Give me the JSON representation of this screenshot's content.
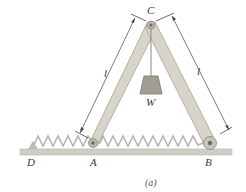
{
  "labels": {
    "C": "C",
    "W": "W",
    "A": "A",
    "B": "B",
    "D": "D",
    "left_length": "l",
    "right_length": "l",
    "caption": "(a)"
  },
  "colors": {
    "bar_fill": "#d6d2c8",
    "bar_stroke": "#a8a49a",
    "ground": "#c8c6c0",
    "spring": "#b8b8b8",
    "weight": "#9a9890",
    "text": "#3a3a3a"
  }
}
